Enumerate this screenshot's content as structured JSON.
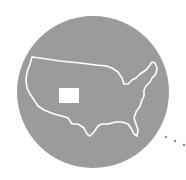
{
  "illustration": {
    "subject": "map of the contiguous United States with Colorado highlighted",
    "circle_color": "#9b9b9b",
    "outline_color": "#ffffff",
    "highlight_color": "#ffffff",
    "dots_color": "#8a8a8a",
    "icons": [
      "usa-map-icon",
      "colorado-state-icon",
      "ellipsis-dots-icon"
    ]
  }
}
